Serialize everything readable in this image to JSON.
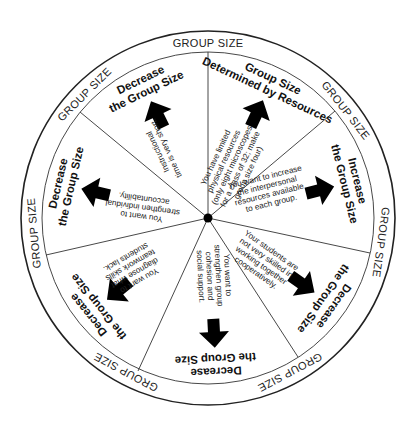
{
  "diagram": {
    "type": "wheel",
    "ring_label": "GROUP SIZE",
    "center": {
      "x": 208,
      "y": 218
    },
    "outer_radius": 187,
    "inner_radius": 166,
    "colors": {
      "line": "#222222",
      "arrow": "#000000",
      "text": "#111111",
      "background": "#ffffff"
    },
    "spoke_angles_deg": [
      0,
      50,
      102,
      147,
      205,
      257,
      309
    ],
    "sectors": [
      {
        "id": "resources",
        "title_line1": "Group Size",
        "title_line2": "Determined by Resources",
        "body": [
          "You have limited",
          "physical resources",
          "(only eight microscopes",
          "for a class of 32; make",
          "group size four)"
        ],
        "arrow": "up"
      },
      {
        "id": "increase",
        "title_line1": "Increase",
        "title_line2": "the Group Size",
        "body": [
          "You want to increase",
          "the interpersonal",
          "resources available",
          "to each group."
        ],
        "arrow": "outward"
      },
      {
        "id": "cooperative",
        "title_line1": "Decrease",
        "title_line2": "the Group Size",
        "body": [
          "Your students are",
          "not very skilled in",
          "working together",
          "cooperatively."
        ],
        "arrow": "outward"
      },
      {
        "id": "cohesion",
        "title_line1": "Decrease",
        "title_line2": "the Group Size",
        "body": [
          "You want to",
          "strengthen group",
          "cohesion and",
          "social support."
        ],
        "arrow": "outward"
      },
      {
        "id": "diagnose",
        "title_line1": "Decrease",
        "title_line2": "the Group Size",
        "body": [
          "You want to",
          "diagnose what",
          "teamwork skills",
          "students lack."
        ],
        "arrow": "outward"
      },
      {
        "id": "accountability",
        "title_line1": "Decrease",
        "title_line2": "the Group Size",
        "body": [
          "You want to",
          "strengthen individual",
          "accountability."
        ],
        "arrow": "outward"
      },
      {
        "id": "time",
        "title_line1": "Decrease",
        "title_line2": "the Group Size",
        "body": [
          "Instructional",
          "time is very short."
        ],
        "arrow": "outward"
      }
    ]
  }
}
